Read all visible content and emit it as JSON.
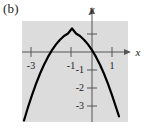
{
  "figure": {
    "panel_label": "(b)",
    "background_color": "#ffffff",
    "plot_area_color": "#dcdcdc",
    "curve_color": "#000000",
    "axis_color": "#555555"
  },
  "chart_data": {
    "type": "line",
    "title": "",
    "subtitle": "",
    "xlabel": "x",
    "ylabel": "y",
    "grid": false,
    "legend": null,
    "xlim": [
      -3.5,
      1.8
    ],
    "ylim": [
      -3.7,
      1.7
    ],
    "xticks": [
      -3,
      -1,
      1
    ],
    "xticklabels": [
      "-3",
      "-1",
      "1"
    ],
    "yticks": [
      -1,
      -2,
      -3
    ],
    "yticklabels": [
      "-1",
      "-2",
      "-3"
    ],
    "series": [
      {
        "name": "downward parabola",
        "vertex": [
          -1,
          1.3
        ],
        "x_intercepts": [
          -2.1,
          0.1
        ],
        "x": [
          -3.4,
          -3.2,
          -3.0,
          -2.8,
          -2.6,
          -2.4,
          -2.2,
          -2.0,
          -1.8,
          -1.6,
          -1.4,
          -1.2,
          -1.0,
          -0.8,
          -0.6,
          -0.4,
          -0.2,
          0.0,
          0.2,
          0.4,
          0.6,
          0.8,
          1.0,
          1.2,
          1.35
        ],
        "y": [
          -3.62,
          -2.91,
          -2.26,
          -1.66,
          -1.12,
          -0.64,
          -0.22,
          0.14,
          0.45,
          0.7,
          0.9,
          1.03,
          1.3,
          1.03,
          0.9,
          0.7,
          0.45,
          0.14,
          -0.22,
          -0.64,
          -1.12,
          -1.66,
          -2.26,
          -2.91,
          -3.4
        ]
      }
    ]
  },
  "annotations": {
    "x_axis_arrow": "arrow-right",
    "y_axis_arrow": "arrow-up"
  }
}
